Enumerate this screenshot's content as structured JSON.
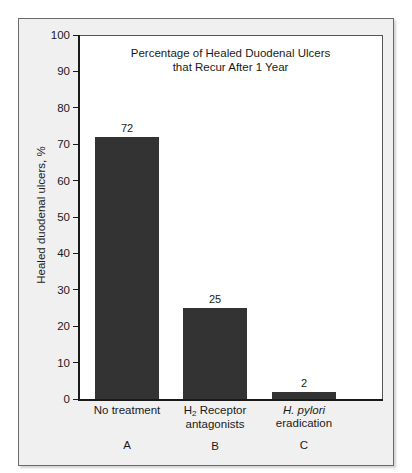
{
  "chart_data": {
    "type": "bar",
    "title": "Percentage of Healed Duodenal Ulcers that Recur After 1 Year",
    "title_line1": "Percentage of Healed Duodenal Ulcers",
    "title_line2": "that Recur After 1 Year",
    "xlabel": "",
    "ylabel": "Healed duodenal ulcers, %",
    "ylim": [
      0,
      100
    ],
    "ytick_labels": [
      "100",
      "90",
      "80",
      "70",
      "60",
      "50",
      "40",
      "30",
      "20",
      "10",
      "0"
    ],
    "ytick_values": [
      100,
      90,
      80,
      70,
      60,
      50,
      40,
      30,
      20,
      10,
      0
    ],
    "grid": false,
    "legend": false,
    "bar_color": "#333333",
    "categories": [
      "No treatment",
      "H2 Receptor antagonists",
      "H. pylori eradication"
    ],
    "category_keys": [
      "A",
      "B",
      "C"
    ],
    "values": [
      72,
      25,
      2
    ],
    "value_labels": [
      "72",
      "25",
      "2"
    ],
    "bars": [
      {
        "key": "A",
        "line1_prefix": "No treatment",
        "line1_prefix_italic": false,
        "line1_suffix": "",
        "line2": "",
        "value": 72,
        "value_label": "72"
      },
      {
        "key": "B",
        "line1_prefix": "H",
        "line1_subscript": "2",
        "line1_suffix": " Receptor",
        "line1_prefix_italic": false,
        "line2": "antagonists",
        "value": 25,
        "value_label": "25"
      },
      {
        "key": "C",
        "line1_prefix": "H. pylori",
        "line1_prefix_italic": true,
        "line1_suffix": "",
        "line2": "eradication",
        "value": 2,
        "value_label": "2"
      }
    ]
  }
}
